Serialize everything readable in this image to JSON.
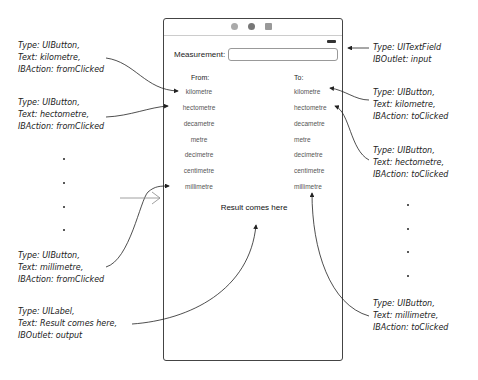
{
  "phone": {
    "title_icons": [
      "circle-icon",
      "gear-circle-icon",
      "square-icon"
    ],
    "measurement_label": "Measurement:",
    "input_value": "",
    "from_header": "From:",
    "to_header": "To:",
    "from_buttons": [
      "kilometre",
      "hectometre",
      "decametre",
      "metre",
      "decimetre",
      "centimetre",
      "millimetre"
    ],
    "to_buttons": [
      "kilometre",
      "hectometre",
      "decametre",
      "metre",
      "decimetre",
      "centimetre",
      "millimetre"
    ],
    "result_label": "Result comes here"
  },
  "annotations": {
    "left": [
      {
        "lines": [
          "Type: UIButton,",
          "Text: kilometre,",
          "IBAction: fromClicked"
        ]
      },
      {
        "lines": [
          "Type: UIButton,",
          "Text: hectometre,",
          "IBAction: fromClicked"
        ]
      },
      {
        "lines": [
          "Type: UIButton,",
          "Text: millimetre,",
          "IBAction: fromClicked"
        ]
      },
      {
        "lines": [
          "Type: UILabel,",
          "Text: Result comes here,",
          "IBOutlet: output"
        ]
      }
    ],
    "right": [
      {
        "lines": [
          "Type: UITextField",
          "IBOutlet: input"
        ]
      },
      {
        "lines": [
          "Type: UIButton,",
          "Text: kilometre,",
          "IBAction: toClicked"
        ]
      },
      {
        "lines": [
          "Type: UIButton,",
          "Text: hectometre,",
          "IBAction: toClicked"
        ]
      },
      {
        "lines": [
          "Type: UIButton,",
          "Text: millimetre,",
          "IBAction: toClicked"
        ]
      }
    ]
  }
}
